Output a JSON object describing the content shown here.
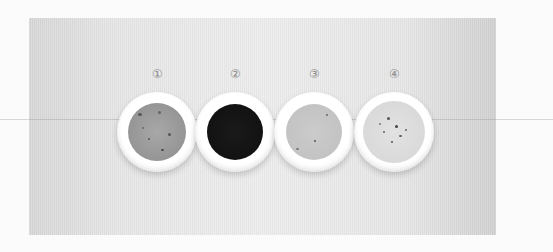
{
  "scene": {
    "description": "Four white bowls containing liquids of varying color on a grey background, numbered 1-4",
    "background_color": "#fbfbfb",
    "panel_color": "#e8e8e8"
  },
  "bowls": [
    {
      "label": "①",
      "liquid_color": "#9c9c9c",
      "liquid_radius": 29,
      "center_x": 157,
      "specks": true
    },
    {
      "label": "②",
      "liquid_color": "#161616",
      "liquid_radius": 28,
      "center_x": 235,
      "specks": false
    },
    {
      "label": "③",
      "liquid_color": "#c6c6c6",
      "liquid_radius": 28,
      "center_x": 314,
      "specks": true
    },
    {
      "label": "④",
      "liquid_color": "#dcdcdc",
      "liquid_radius": 31,
      "center_x": 394,
      "specks": true
    }
  ]
}
